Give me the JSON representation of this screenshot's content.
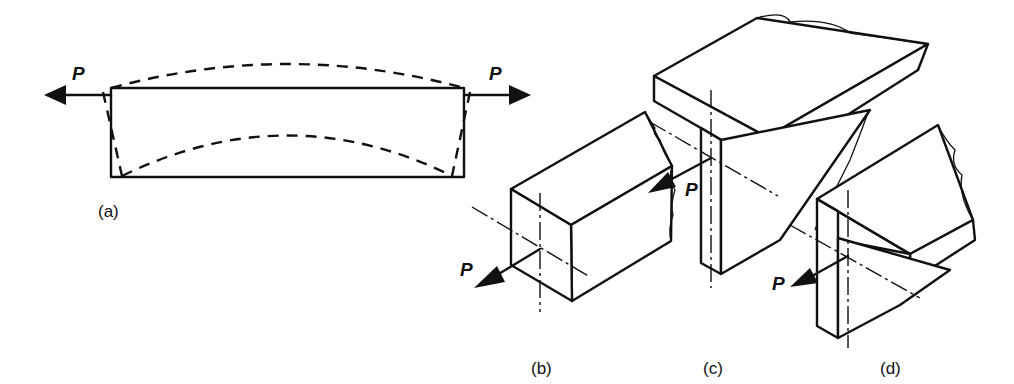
{
  "diagram": {
    "background": "#ffffff",
    "line_color": "#111111",
    "panels": [
      {
        "id": "a",
        "label": "(a)",
        "description": "Plate under axial tension P with dashed deformed shape (shear lag)",
        "force_labels": [
          "P",
          "P"
        ]
      },
      {
        "id": "b",
        "label": "(b)",
        "description": "Rectangular section member with eccentric load P",
        "force_labels": [
          "P"
        ]
      },
      {
        "id": "c",
        "label": "(c)",
        "description": "T-section member with load P applied at web",
        "force_labels": [
          "P"
        ]
      },
      {
        "id": "d",
        "label": "(d)",
        "description": "Angle section member with load P applied at leg",
        "force_labels": [
          "P"
        ]
      }
    ]
  }
}
